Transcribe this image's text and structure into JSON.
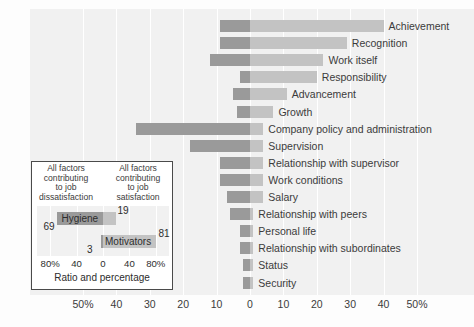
{
  "chart_data": {
    "type": "bar",
    "orientation": "horizontal",
    "subtype": "diverging-stacked",
    "title": "",
    "xlabel": "",
    "ylabel": "",
    "xlim": [
      -60,
      60
    ],
    "grid": true,
    "legend_position": "inset-bottom-left",
    "axis": {
      "tick_labels": [
        "50%",
        "40",
        "30",
        "20",
        "10",
        "0",
        "10",
        "20",
        "30",
        "40",
        "50%"
      ],
      "tick_values": [
        -50,
        -40,
        -30,
        -20,
        -10,
        0,
        10,
        20,
        30,
        40,
        50
      ]
    },
    "categories": [
      "Achievement",
      "Recognition",
      "Work itself",
      "Responsibility",
      "Advancement",
      "Growth",
      "Company policy and administration",
      "Supervision",
      "Relationship with supervisor",
      "Work conditions",
      "Salary",
      "Relationship with peers",
      "Personal life",
      "Relationship with subordinates",
      "Status",
      "Security"
    ],
    "series": [
      {
        "name": "Factors characterizing events on the job that led to extreme dissatisfaction",
        "side": "left",
        "color": "#9a9a9a",
        "values": [
          9,
          9,
          12,
          3,
          5,
          4,
          34,
          18,
          9,
          9,
          7,
          6,
          3,
          3,
          2,
          2
        ]
      },
      {
        "name": "Factors characterizing events on the job that led to extreme satisfaction",
        "side": "right",
        "color": "#c3c3c3",
        "values": [
          40,
          29,
          22,
          20,
          11,
          7,
          4,
          4,
          4,
          4,
          4,
          1,
          1,
          1,
          1,
          1
        ]
      }
    ]
  },
  "axis": {
    "ticks": [
      {
        "label": "50%",
        "value": -50
      },
      {
        "label": "40",
        "value": -40
      },
      {
        "label": "30",
        "value": -30
      },
      {
        "label": "20",
        "value": -20
      },
      {
        "label": "10",
        "value": -10
      },
      {
        "label": "0",
        "value": 0
      },
      {
        "label": "10",
        "value": 10
      },
      {
        "label": "20",
        "value": 20
      },
      {
        "label": "30",
        "value": 30
      },
      {
        "label": "40",
        "value": 40
      },
      {
        "label": "50%",
        "value": 50
      }
    ]
  },
  "bars": [
    {
      "label": "Achievement",
      "neg": 9,
      "pos": 40
    },
    {
      "label": "Recognition",
      "neg": 9,
      "pos": 29
    },
    {
      "label": "Work itself",
      "neg": 12,
      "pos": 22
    },
    {
      "label": "Responsibility",
      "neg": 3,
      "pos": 20
    },
    {
      "label": "Advancement",
      "neg": 5,
      "pos": 11
    },
    {
      "label": "Growth",
      "neg": 4,
      "pos": 7
    },
    {
      "label": "Company policy and administration",
      "neg": 34,
      "pos": 4
    },
    {
      "label": "Supervision",
      "neg": 18,
      "pos": 4
    },
    {
      "label": "Relationship with supervisor",
      "neg": 9,
      "pos": 4
    },
    {
      "label": "Work conditions",
      "neg": 9,
      "pos": 4
    },
    {
      "label": "Salary",
      "neg": 7,
      "pos": 4
    },
    {
      "label": "Relationship with peers",
      "neg": 6,
      "pos": 1
    },
    {
      "label": "Personal life",
      "neg": 3,
      "pos": 1
    },
    {
      "label": "Relationship with subordinates",
      "neg": 3,
      "pos": 1
    },
    {
      "label": "Status",
      "neg": 2,
      "pos": 1
    },
    {
      "label": "Security",
      "neg": 2,
      "pos": 1
    }
  ],
  "inset": {
    "head_left": "All factors\ncontributing\nto job\ndissatisfaction",
    "head_right": "All factors\ncontributing\nto job\nsatisfaction",
    "head_left_lines": [
      "All factors",
      "contributing",
      "to job",
      "dissatisfaction"
    ],
    "head_right_lines": [
      "All factors",
      "contributing",
      "to job",
      "satisfaction"
    ],
    "bars": [
      {
        "label": "Hygiene",
        "neg": 69,
        "pos": 19
      },
      {
        "label": "Motivators",
        "neg": 3,
        "pos": 81
      }
    ],
    "values": {
      "hygiene_neg": "69",
      "hygiene_pos": "19",
      "motivators_neg": "3",
      "motivators_pos": "81"
    },
    "ticks": [
      {
        "label": "80%",
        "value": -80
      },
      {
        "label": "40",
        "value": -40
      },
      {
        "label": "0",
        "value": 0
      },
      {
        "label": "40",
        "value": 40
      },
      {
        "label": "80%",
        "value": 80
      }
    ],
    "caption": "Ratio and percentage"
  },
  "colors": {
    "panel": "#f1f1f1",
    "grid": "#ffffff",
    "bar_dissatisfaction": "#9a9a9a",
    "bar_satisfaction": "#c3c3c3",
    "text": "#3b3b3b",
    "inset_border": "#4a4a4a"
  }
}
